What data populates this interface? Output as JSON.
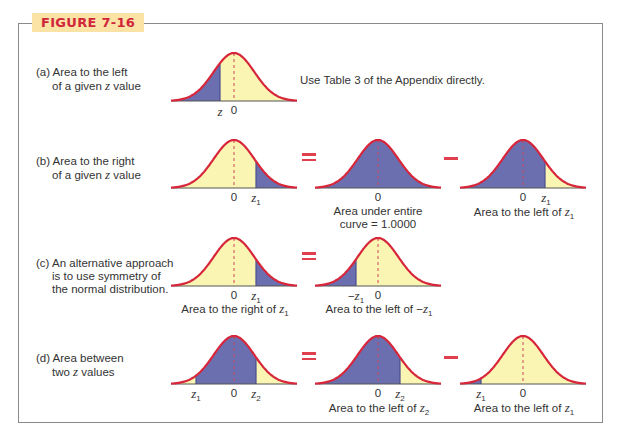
{
  "figure": {
    "title": "FIGURE 7-16",
    "colors": {
      "curve": "#d7263a",
      "shaded": "#6b6fb0",
      "unshaded": "#fbf5b4",
      "title_bg": "#fbe3a6",
      "title_text": "#d0263a",
      "operator": "#e0404e"
    }
  },
  "rows": {
    "a": {
      "label_line1": "(a) Area to the left",
      "label_line2_pre": "of a given ",
      "label_line2_var": "z",
      "label_line2_post": " value",
      "note": "Use Table 3 of the Appendix directly.",
      "ticks": [
        "z",
        "0"
      ]
    },
    "b": {
      "label_line1": "(b) Area to the right",
      "label_line2_pre": "of a given ",
      "label_line2_var": "z",
      "label_line2_post": " value",
      "ticks1": [
        "0",
        "z1"
      ],
      "ticks2": [
        "0"
      ],
      "caption2_line1": "Area under entire",
      "caption2_line2": "curve = 1.0000",
      "ticks3": [
        "0",
        "z1"
      ],
      "caption3": "Area to the left of z1"
    },
    "c": {
      "label_line1": "(c) An alternative approach",
      "label_line2": "is to use symmetry of",
      "label_line3": "the normal distribution.",
      "ticks1": [
        "0",
        "z1"
      ],
      "caption1": "Area to the right of z1",
      "ticks2": [
        "−z1",
        "0"
      ],
      "caption2": "Area to the left of −z1"
    },
    "d": {
      "label_line1": "(d) Area between",
      "label_line2_pre": "two ",
      "label_line2_var": "z",
      "label_line2_post": " values",
      "ticks1": [
        "z1",
        "0",
        "z2"
      ],
      "ticks2": [
        "0",
        "z2"
      ],
      "caption2": "Area to the left of z2",
      "ticks3": [
        "z1",
        "0"
      ],
      "caption3": "Area to the left of z1"
    }
  },
  "operators": {
    "equals": "=",
    "minus": "−"
  },
  "chart_data": {
    "type": "area",
    "title": "FIGURE 7-16",
    "panels": [
      {
        "id": "a",
        "shading": "left of z",
        "z_marks": [
          "z",
          "0"
        ]
      },
      {
        "id": "b1",
        "shading": "right of z1",
        "z_marks": [
          "0",
          "z1"
        ]
      },
      {
        "id": "b2",
        "shading": "entire curve",
        "area": 1.0,
        "z_marks": [
          "0"
        ]
      },
      {
        "id": "b3",
        "shading": "left of z1",
        "z_marks": [
          "0",
          "z1"
        ]
      },
      {
        "id": "c1",
        "shading": "right of z1",
        "z_marks": [
          "0",
          "z1"
        ]
      },
      {
        "id": "c2",
        "shading": "left of -z1",
        "z_marks": [
          "-z1",
          "0"
        ]
      },
      {
        "id": "d1",
        "shading": "between z1 and z2",
        "z_marks": [
          "z1",
          "0",
          "z2"
        ]
      },
      {
        "id": "d2",
        "shading": "left of z2",
        "z_marks": [
          "0",
          "z2"
        ]
      },
      {
        "id": "d3",
        "shading": "left of z1",
        "z_marks": [
          "z1",
          "0"
        ]
      }
    ]
  }
}
